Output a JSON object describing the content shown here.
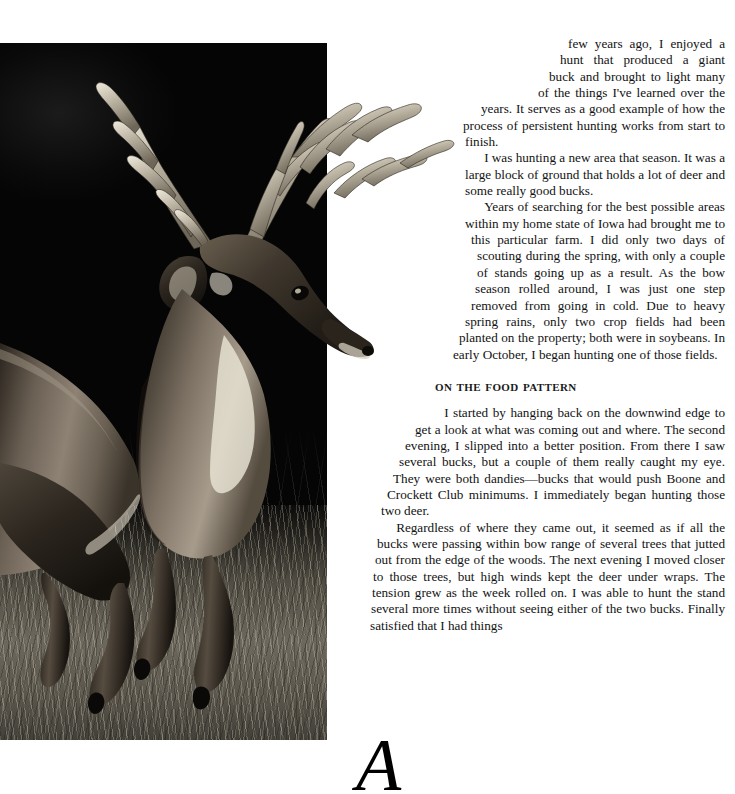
{
  "page": {
    "width": 735,
    "height": 756,
    "background_color": "#ffffff",
    "text_color": "#121212"
  },
  "photo": {
    "alt_description": "Black and white photograph of a large whitetail buck leaping through tall grass at the edge of dark woods",
    "subject": "whitetail-buck",
    "treatment": "black-and-white",
    "backdrop_color": "#070707",
    "grass_color": "#7a7568"
  },
  "article": {
    "dropcap": "A",
    "paragraphs": [
      "few years ago, I enjoyed a hunt that produced a giant buck and brought to light many of the things I've learned over the years. It serves as a good example of how the process of persistent hunting works from start to finish.",
      "I was hunting a new area that season. It was a large block of ground that holds a lot of deer and some really good bucks.",
      "Years of searching for the best possible areas within my home state of Iowa had brought me to this particular farm. I did only two days of scouting during the spring, with only a couple of stands going up as a result. As the bow season rolled around, I was just one step removed from going in cold. Due to heavy spring rains, only two crop fields had been planted on the property; both were in soybeans. In early October, I began hunting one of those fields."
    ],
    "section": {
      "heading": "On the Food Pattern",
      "paragraphs": [
        "I started by hanging back on the downwind edge to get a look at what was coming out and where. The second evening, I slipped into a better position. From there I saw several bucks, but a couple of them really caught my eye. They were both dandies—bucks that would push Boone and Crockett Club minimums. I immediately began hunting those two deer.",
        "Regardless of where they came out, it seemed as if all the bucks were passing within bow range of several trees that jutted out from the edge of the woods. The next evening I moved closer to those trees, but high winds kept the deer under wraps. The tension grew as the week rolled on. I was able to hunt the stand several more times without seeing either of the two bucks. Finally satisfied that I had things"
      ]
    }
  }
}
